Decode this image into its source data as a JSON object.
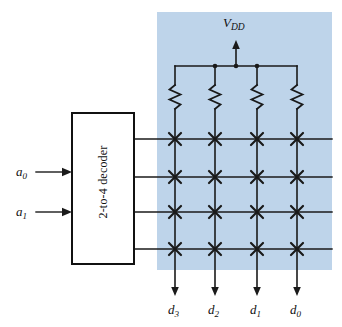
{
  "figure": {
    "background_color": "#ffffff",
    "array_region_color": "#bed4ea"
  },
  "decoder": {
    "label": "2-to-4 decoder",
    "orientation": "vertical-text",
    "box": {
      "x": 72,
      "y": 113,
      "width": 62,
      "height": 151
    }
  },
  "inputs": [
    {
      "name": "a0",
      "base": "a",
      "sub": "0",
      "y": 172
    },
    {
      "name": "a1",
      "base": "a",
      "sub": "1",
      "y": 212
    }
  ],
  "supply": {
    "base": "V",
    "sub": "DD",
    "label": "VDD",
    "arrow_x": 236,
    "rail_y": 66
  },
  "outputs": [
    {
      "name": "d3",
      "base": "d",
      "sub": "3",
      "x": 175
    },
    {
      "name": "d2",
      "base": "d",
      "sub": "2",
      "x": 215
    },
    {
      "name": "d1",
      "base": "d",
      "sub": "1",
      "x": 257
    },
    {
      "name": "d0",
      "base": "d",
      "sub": "0",
      "x": 297
    }
  ],
  "array": {
    "rows": 4,
    "columns": 4,
    "row_y": [
      139,
      177,
      212,
      249
    ],
    "column_x": [
      175,
      215,
      257,
      297
    ],
    "cell_marker": "x-cross",
    "resistor_count": 4,
    "junction_dot_x": [
      215,
      236,
      257
    ],
    "region": {
      "x": 157,
      "y": 12,
      "width": 175,
      "height": 258
    }
  },
  "colors": {
    "wire": "#1a1a1a",
    "shade": "#bed4ea",
    "text": "#111111",
    "box_fill": "#ffffff"
  }
}
